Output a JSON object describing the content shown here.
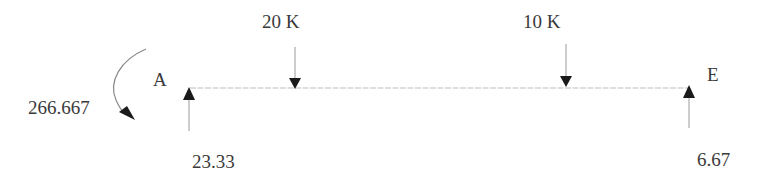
{
  "diagram": {
    "type": "beam-free-body-diagram",
    "colors": {
      "beam": "#bdbdbd",
      "arrow": "#1a1a1a",
      "arrow_line": "#9a9a9a",
      "text": "#3a3a3a"
    },
    "nodes": [
      {
        "id": "A",
        "label": "A"
      },
      {
        "id": "E",
        "label": "E"
      }
    ],
    "loads": [
      {
        "id": "load-20k",
        "label": "20 K",
        "direction": "down"
      },
      {
        "id": "load-10k",
        "label": "10 K",
        "direction": "down"
      }
    ],
    "reactions": [
      {
        "id": "reaction-a",
        "label": "23.33",
        "direction": "up",
        "at": "A"
      },
      {
        "id": "reaction-e",
        "label": "6.67",
        "direction": "up",
        "at": "E"
      }
    ],
    "moments": [
      {
        "id": "moment-a",
        "label": "266.667",
        "direction": "counterclockwise",
        "at": "A"
      }
    ]
  }
}
